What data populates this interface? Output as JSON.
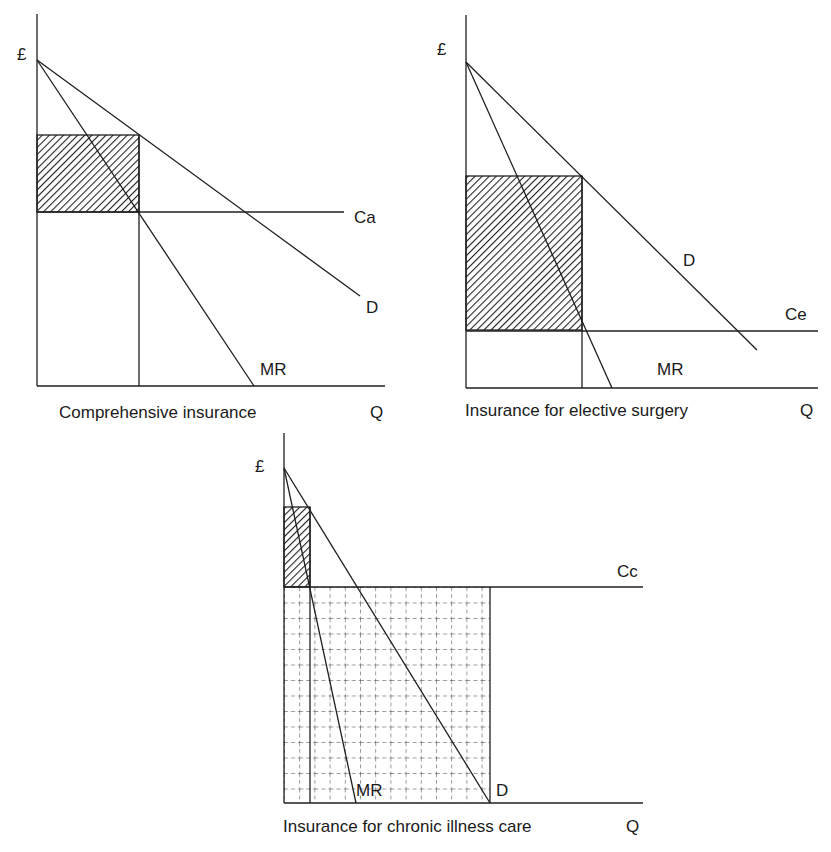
{
  "colors": {
    "ink": "#1f1f1f",
    "background": "#ffffff"
  },
  "charts": [
    {
      "id": "comprehensive",
      "caption": "Comprehensive insurance",
      "y_axis_label": "£",
      "x_axis_label": "Q",
      "cost_label": "Ca",
      "demand_label": "D",
      "mr_label": "MR",
      "shaded_area": "hatched (monopoly profit)"
    },
    {
      "id": "elective",
      "caption": "Insurance for elective surgery",
      "y_axis_label": "£",
      "x_axis_label": "Q",
      "cost_label": "Ce",
      "demand_label": "D",
      "mr_label": "MR",
      "shaded_area": "hatched (monopoly profit)"
    },
    {
      "id": "chronic",
      "caption": "Insurance for chronic illness care",
      "y_axis_label": "£",
      "x_axis_label": "Q",
      "cost_label": "Cc",
      "demand_label": "D",
      "mr_label": "MR",
      "shaded_area": "hatched (monopoly profit) and dashed grid (cost area)"
    }
  ]
}
